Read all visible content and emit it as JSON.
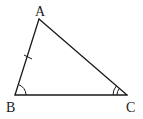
{
  "diagram": {
    "type": "triangle",
    "colors": {
      "stroke": "#1a1a1a",
      "background": "#ffffff"
    },
    "vertices": [
      {
        "id": "A",
        "label": "A",
        "x": 39,
        "y": 19
      },
      {
        "id": "B",
        "label": "B",
        "x": 15,
        "y": 95
      },
      {
        "id": "C",
        "label": "C",
        "x": 127,
        "y": 95
      }
    ],
    "edges": [
      {
        "from": "A",
        "to": "B",
        "marks": "single-tick"
      },
      {
        "from": "A",
        "to": "C",
        "marks": "none"
      },
      {
        "from": "B",
        "to": "C",
        "marks": "none"
      }
    ],
    "angle_marks": [
      {
        "vertex": "B",
        "arcs": 1
      },
      {
        "vertex": "C",
        "arcs": 2
      }
    ]
  }
}
